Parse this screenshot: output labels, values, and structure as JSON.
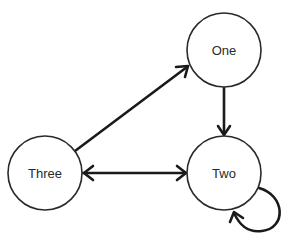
{
  "diagram": {
    "type": "directed-graph",
    "nodes": [
      {
        "id": "one",
        "label": "One",
        "cx": 224,
        "cy": 50,
        "r": 37
      },
      {
        "id": "two",
        "label": "Two",
        "cx": 224,
        "cy": 173,
        "r": 37
      },
      {
        "id": "three",
        "label": "Three",
        "cx": 45,
        "cy": 173,
        "r": 37
      }
    ],
    "edges": [
      {
        "from": "three",
        "to": "one",
        "direction": "forward"
      },
      {
        "from": "one",
        "to": "two",
        "direction": "forward"
      },
      {
        "from": "three",
        "to": "two",
        "direction": "bidirectional"
      },
      {
        "from": "two",
        "to": "two",
        "direction": "self-loop"
      }
    ],
    "colors": {
      "stroke": "#1a1a1a",
      "node_fill": "#ffffff",
      "background": "#ffffff"
    }
  }
}
